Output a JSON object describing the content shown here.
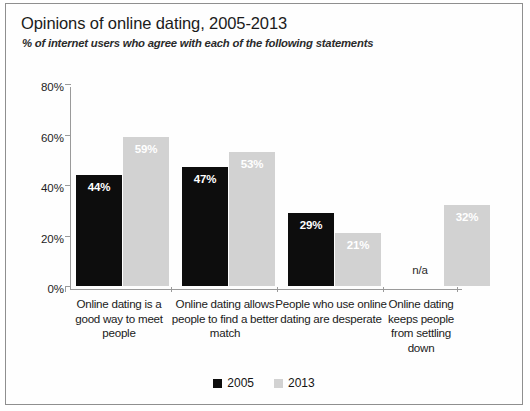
{
  "chart_data": {
    "type": "bar",
    "title": "Opinions of online dating, 2005-2013",
    "subtitle": "% of internet users who agree with each of the following statements",
    "xlabel": "",
    "ylabel": "",
    "ylim": [
      0,
      80
    ],
    "ytick_labels": [
      "0%",
      "20%",
      "40%",
      "60%",
      "80%"
    ],
    "ytick_values": [
      0,
      20,
      40,
      60,
      80
    ],
    "grid": false,
    "legend_position": "bottom",
    "categories": [
      "Online dating is a good way to meet people",
      "Online dating allows people to find a better match",
      "People who use online dating are desperate",
      "Online dating keeps people from settling down"
    ],
    "series": [
      {
        "name": "2005",
        "color": "#0d0d0d",
        "values": [
          44,
          47,
          29,
          null
        ],
        "labels": [
          "44%",
          "47%",
          "29%",
          "n/a"
        ]
      },
      {
        "name": "2013",
        "color": "#d2d2d2",
        "values": [
          59,
          53,
          21,
          32
        ],
        "labels": [
          "59%",
          "53%",
          "21%",
          "32%"
        ]
      }
    ]
  },
  "legend": {
    "items": [
      {
        "label": "2005",
        "color": "#0d0d0d"
      },
      {
        "label": "2013",
        "color": "#d2d2d2"
      }
    ]
  }
}
